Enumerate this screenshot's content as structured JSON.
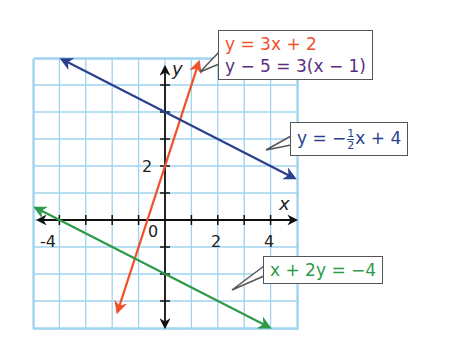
{
  "graph": {
    "x_range": [
      -5,
      5
    ],
    "y_range": [
      -4,
      6
    ],
    "axis_labels": {
      "x": "x",
      "y": "y"
    },
    "tick_labels": {
      "x": [
        "-4",
        "2",
        "4"
      ],
      "y": [
        "2"
      ],
      "origin": "0"
    },
    "grid_color": "#9fd3ef",
    "axis_color": "#111111"
  },
  "lines": [
    {
      "name": "orange-line",
      "equation": "y = 3x + 2",
      "slope": 3,
      "intercept": 2,
      "color": "#f0502a"
    },
    {
      "name": "blue-line",
      "equation": "y = -1/2 x + 4",
      "slope": -0.5,
      "intercept": 4,
      "color": "#2b3f8f"
    },
    {
      "name": "green-line",
      "equation": "x + 2y = -4",
      "slope": -0.5,
      "intercept": -2,
      "color": "#2e9a48"
    }
  ],
  "callouts": {
    "orange": {
      "line1": "y = 3x + 2",
      "line2": "y − 5 = 3(x − 1)",
      "color1": "#f0502a",
      "color2": "#5a2d82"
    },
    "blue": {
      "text_pre": "y = −",
      "frac_num": "1",
      "frac_den": "2",
      "text_post": "x + 4",
      "color": "#2b3f8f"
    },
    "green": {
      "text": "x + 2y = −4",
      "color": "#2e9a48"
    }
  }
}
